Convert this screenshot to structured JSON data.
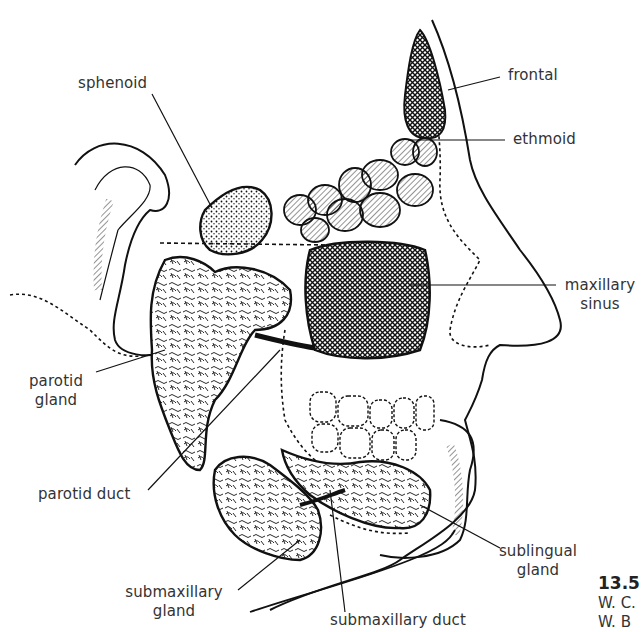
{
  "figure": {
    "number": "13.5",
    "credit_lines": [
      "W. C.",
      "W. B"
    ]
  },
  "labels": {
    "sphenoid": "sphenoid",
    "frontal": "frontal",
    "ethmoid": "ethmoid",
    "maxillary_sinus_1": "maxillary",
    "maxillary_sinus_2": "sinus",
    "parotid_gland_1": "parotid",
    "parotid_gland_2": "gland",
    "parotid_duct": "parotid duct",
    "sublingual_gland_1": "sublingual",
    "sublingual_gland_2": "gland",
    "submaxillary_gland_1": "submaxillary",
    "submaxillary_gland_2": "gland",
    "submaxillary_duct": "submaxillary duct"
  },
  "colors": {
    "ink": "#111111",
    "paper": "#ffffff",
    "text": "#333333"
  }
}
